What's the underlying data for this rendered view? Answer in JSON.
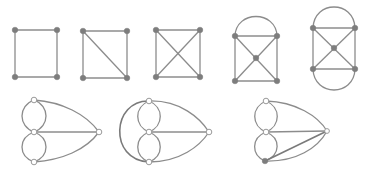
{
  "figure": {
    "colors": {
      "edge": "#8c8c8c",
      "node_filled": "#7d7d7d",
      "node_open": "#ffffff",
      "background": "#ffffff"
    }
  },
  "graphs": [
    {
      "id": "g1",
      "row": 1,
      "name": "4-cycle"
    },
    {
      "id": "g2",
      "row": 1,
      "name": "4-cycle with one diagonal"
    },
    {
      "id": "g3",
      "row": 1,
      "name": "4-cycle with both diagonals crossing"
    },
    {
      "id": "g4",
      "row": 1,
      "name": "wheel with center vertex and top arc"
    },
    {
      "id": "g5",
      "row": 1,
      "name": "wheel with center vertex and top and bottom arcs"
    },
    {
      "id": "g6",
      "row": 2,
      "name": "multigraph with double loops and curved edges to right vertex"
    },
    {
      "id": "g7",
      "row": 2,
      "name": "multigraph with outer left arc"
    },
    {
      "id": "g8",
      "row": 2,
      "name": "multigraph with doubled bottom-right edge"
    }
  ]
}
